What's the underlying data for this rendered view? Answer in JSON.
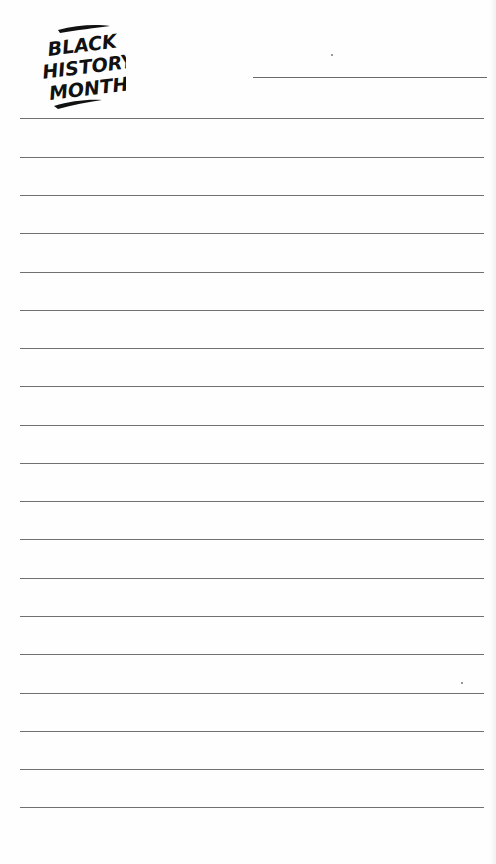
{
  "document": {
    "type": "lined-notepad-page",
    "logo": {
      "lines": [
        "BLACK",
        "HISTORY",
        "MONTH"
      ],
      "style": "brush-lettering",
      "color": "#111111"
    },
    "header_line": {
      "label": ""
    },
    "ruled_lines": {
      "count": 19,
      "positions_y": [
        118,
        157,
        195,
        233,
        272,
        310,
        348,
        386,
        425,
        463,
        501,
        539,
        578,
        616,
        654,
        693,
        731,
        769,
        807
      ],
      "color": "#707070"
    },
    "background_color": "#ffffff"
  }
}
